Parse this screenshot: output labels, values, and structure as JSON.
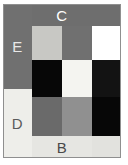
{
  "figure": {
    "type": "color-block-grid",
    "background": "#ffffff",
    "outline_color": "#8f8f8f",
    "columns": [
      {
        "index": 0,
        "x": 3,
        "width": 29
      },
      {
        "index": 1,
        "x": 32,
        "width": 30
      },
      {
        "index": 2,
        "x": 62,
        "width": 30
      },
      {
        "index": 3,
        "x": 92,
        "width": 29
      }
    ],
    "rows": [
      {
        "index": 0,
        "y": 4,
        "height": 22
      },
      {
        "index": 1,
        "y": 26,
        "height": 34
      },
      {
        "index": 2,
        "y": 60,
        "height": 37
      },
      {
        "index": 3,
        "y": 97,
        "height": 39
      },
      {
        "index": 4,
        "y": 136,
        "height": 22
      }
    ],
    "cells": [
      {
        "name": "cell-e",
        "label": "E",
        "label_color": "#e8e8e8",
        "fill": "#707070",
        "x": 3,
        "y": 4,
        "width": 29,
        "height": 85
      },
      {
        "name": "cell-d",
        "label": "D",
        "label_color": "#5a5a5a",
        "fill": "#eeeeea",
        "x": 3,
        "y": 89,
        "width": 29,
        "height": 69
      },
      {
        "name": "cell-c",
        "label": "C",
        "label_color": "#ffffff",
        "fill": "#6e6e6e",
        "x": 32,
        "y": 4,
        "width": 60,
        "height": 22
      },
      {
        "name": "cell-r0c3",
        "label": "",
        "label_color": "#000000",
        "fill": "#6e6e6e",
        "x": 92,
        "y": 4,
        "width": 29,
        "height": 22
      },
      {
        "name": "cell-r1c1",
        "label": "",
        "label_color": "#000000",
        "fill": "#c8c8c4",
        "x": 32,
        "y": 26,
        "width": 30,
        "height": 34
      },
      {
        "name": "cell-r1c2",
        "label": "",
        "label_color": "#000000",
        "fill": "#707070",
        "x": 62,
        "y": 26,
        "width": 30,
        "height": 34
      },
      {
        "name": "cell-r1c3",
        "label": "",
        "label_color": "#000000",
        "fill": "#ffffff",
        "x": 92,
        "y": 26,
        "width": 29,
        "height": 34
      },
      {
        "name": "cell-r2c1",
        "label": "",
        "label_color": "#000000",
        "fill": "#070707",
        "x": 32,
        "y": 60,
        "width": 30,
        "height": 37
      },
      {
        "name": "cell-r2c2",
        "label": "",
        "label_color": "#000000",
        "fill": "#f4f4f0",
        "x": 62,
        "y": 60,
        "width": 30,
        "height": 37
      },
      {
        "name": "cell-r2c3",
        "label": "",
        "label_color": "#000000",
        "fill": "#131313",
        "x": 92,
        "y": 60,
        "width": 29,
        "height": 37
      },
      {
        "name": "cell-r3c1",
        "label": "",
        "label_color": "#000000",
        "fill": "#6a6a6a",
        "x": 32,
        "y": 97,
        "width": 30,
        "height": 39
      },
      {
        "name": "cell-r3c2",
        "label": "",
        "label_color": "#000000",
        "fill": "#909090",
        "x": 62,
        "y": 97,
        "width": 30,
        "height": 39
      },
      {
        "name": "cell-r3c3",
        "label": "",
        "label_color": "#000000",
        "fill": "#070707",
        "x": 92,
        "y": 97,
        "width": 29,
        "height": 39
      },
      {
        "name": "cell-b",
        "label": "B",
        "label_color": "#4a4a4a",
        "fill": "#e6e6e2",
        "x": 32,
        "y": 136,
        "width": 60,
        "height": 22
      },
      {
        "name": "cell-r4c3",
        "label": "",
        "label_color": "#000000",
        "fill": "#e2e2de",
        "x": 92,
        "y": 136,
        "width": 29,
        "height": 22
      }
    ]
  }
}
